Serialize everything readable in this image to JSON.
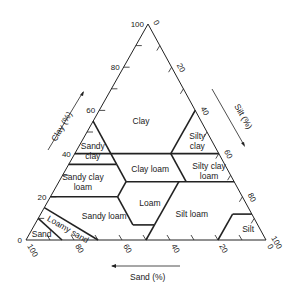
{
  "diagram": {
    "type": "soil-texture-triangle",
    "axes": {
      "clay": {
        "label": "Clay (%)",
        "ticks": [
          "0",
          "20",
          "40",
          "60",
          "80",
          "100"
        ]
      },
      "silt": {
        "label": "Silt (%)",
        "ticks": [
          "0",
          "20",
          "40",
          "60",
          "80",
          "100"
        ]
      },
      "sand": {
        "label": "Sand (%)",
        "ticks": [
          "100",
          "80",
          "60",
          "40",
          "20",
          "0"
        ]
      }
    },
    "classes": [
      {
        "name": "clay",
        "lines": [
          "Clay"
        ]
      },
      {
        "name": "sandy-clay",
        "lines": [
          "Sandy",
          "clay"
        ]
      },
      {
        "name": "silty-clay",
        "lines": [
          "Silty",
          "clay"
        ]
      },
      {
        "name": "clay-loam",
        "lines": [
          "Clay loam"
        ]
      },
      {
        "name": "silty-clay-loam",
        "lines": [
          "Silty clay",
          "loam"
        ]
      },
      {
        "name": "sandy-clay-loam",
        "lines": [
          "Sandy clay",
          "loam"
        ]
      },
      {
        "name": "loam",
        "lines": [
          "Loam"
        ]
      },
      {
        "name": "silt-loam",
        "lines": [
          "Silt loam"
        ]
      },
      {
        "name": "silt",
        "lines": [
          "Silt"
        ]
      },
      {
        "name": "sandy-loam",
        "lines": [
          "Sandy loam"
        ]
      },
      {
        "name": "loamy-sand",
        "lines": [
          "Loamy sand"
        ]
      },
      {
        "name": "sand",
        "lines": [
          "Sand"
        ]
      }
    ]
  }
}
